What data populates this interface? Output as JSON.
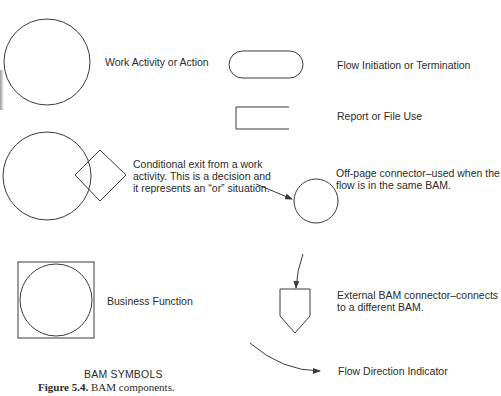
{
  "symbols": {
    "work_activity": {
      "label": "Work Activity or Action"
    },
    "flow_initiation": {
      "label": "Flow Initiation or Termination"
    },
    "report_file": {
      "label": "Report or File Use"
    },
    "conditional_exit": {
      "lines": [
        "Conditional exit from a work",
        "activity. This is a decision and",
        "it represents an “or” situation."
      ]
    },
    "off_page_connector": {
      "lines": [
        "Off-page connector–used when the",
        "flow is in the same BAM."
      ]
    },
    "business_function": {
      "label": "Business Function"
    },
    "external_connector": {
      "lines": [
        "External BAM connector–connects",
        "to a different BAM."
      ]
    },
    "flow_direction": {
      "label": "Flow Direction Indicator"
    }
  },
  "caption": {
    "title": "BAM SYMBOLS",
    "figure_number": "Figure 5.4.",
    "figure_text": "BAM components."
  },
  "colors": {
    "stroke": "#3a3a3a",
    "text": "#2b2b2b",
    "background": "#ffffff"
  }
}
